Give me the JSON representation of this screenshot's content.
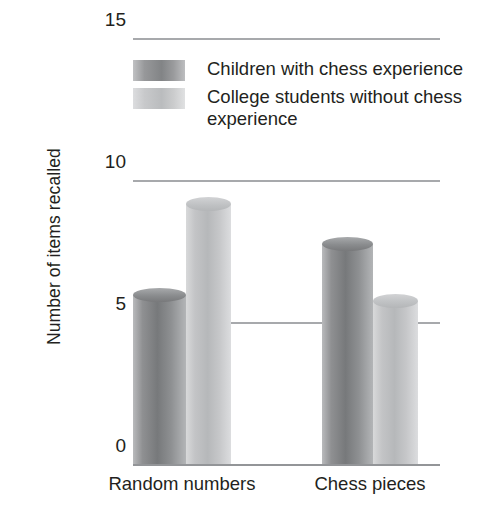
{
  "chart_data": {
    "type": "bar",
    "title": "",
    "xlabel": "",
    "ylabel": "Number of items recalled",
    "categories": [
      "Random numbers",
      "Chess pieces"
    ],
    "series": [
      {
        "name": "Children with chess experience",
        "values": [
          6.2,
          8.0
        ],
        "color": "#808284"
      },
      {
        "name": "College students without chess experience",
        "values": [
          9.4,
          6.0
        ],
        "color": "#c2c4c6"
      }
    ],
    "ylim": [
      0,
      15
    ],
    "yticks": [
      0,
      5,
      10,
      15
    ],
    "ytick_labels": [
      "0",
      "5",
      "10",
      "15"
    ],
    "grid": true,
    "legend_position": "upper-center",
    "bar_style": "3d-cylinder"
  },
  "axes": {
    "y_title": "Number of items recalled",
    "y_ticks": [
      {
        "label": "15",
        "value": 15
      },
      {
        "label": "10",
        "value": 10
      },
      {
        "label": "5",
        "value": 5
      },
      {
        "label": "0",
        "value": 0
      }
    ],
    "x_categories": [
      {
        "label": "Random numbers"
      },
      {
        "label": "Chess pieces"
      }
    ]
  },
  "legend": {
    "entries": [
      {
        "label": "Children with chess experience",
        "swatch": "dark"
      },
      {
        "label": "College students without chess experience",
        "swatch": "light"
      }
    ]
  }
}
